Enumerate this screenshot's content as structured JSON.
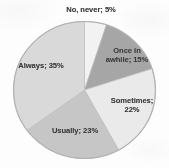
{
  "chart_data": {
    "type": "pie",
    "title": "",
    "subtitle": "",
    "xlabel": "",
    "ylabel": "",
    "legend_position": "none",
    "grid": false,
    "start_angle_deg": 0,
    "direction": "clockwise",
    "categories": [
      "No, never",
      "Once in awhile",
      "Sometimes",
      "Usually",
      "Always"
    ],
    "values": [
      5,
      15,
      22,
      23,
      35
    ],
    "value_unit": "%",
    "labels": [
      "No, never; 5%",
      "Once in\nawhile; 15%",
      "Sometimes;\n22%",
      "Usually; 23%",
      "Always; 35%"
    ],
    "slice_colors": [
      "#f2f2f2",
      "#a6a6a6",
      "#eaeaea",
      "#c6c6c6",
      "#d9d9d9"
    ],
    "series": [
      {
        "name": "Responses",
        "values": [
          5,
          15,
          22,
          23,
          35
        ]
      }
    ]
  },
  "chart": {
    "slices": [
      {
        "name": "No, never",
        "label": "No, never; 5%",
        "value": 5,
        "color": "#f2f2f2"
      },
      {
        "name": "Once in awhile",
        "label": "Once in\nawhile; 15%",
        "value": 15,
        "color": "#a6a6a6"
      },
      {
        "name": "Sometimes",
        "label": "Sometimes;\n22%",
        "value": 22,
        "color": "#eaeaea"
      },
      {
        "name": "Usually",
        "label": "Usually; 23%",
        "value": 23,
        "color": "#c6c6c6"
      },
      {
        "name": "Always",
        "label": "Always; 35%",
        "value": 35,
        "color": "#d9d9d9"
      }
    ]
  }
}
